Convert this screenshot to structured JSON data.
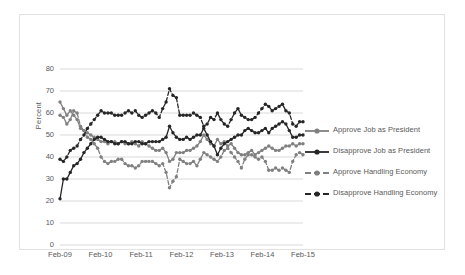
{
  "chart_data": {
    "type": "line",
    "title": "",
    "xlabel": "",
    "ylabel": "Percent",
    "ylim": [
      0,
      80
    ],
    "yticks": [
      0,
      10,
      20,
      30,
      40,
      50,
      60,
      70,
      80
    ],
    "xticks": [
      "Feb-09",
      "Feb-10",
      "Feb-11",
      "Feb-12",
      "Feb-13",
      "Feb-14",
      "Feb-15"
    ],
    "grid": "horizontal",
    "legend_position": "right",
    "colors": {
      "approve_job": "#808080",
      "disapprove_job": "#262626",
      "approve_economy": "#808080",
      "disapprove_economy": "#262626",
      "gridline": "#d9d9d9",
      "text": "#595959",
      "frame": "#e2e2e2"
    },
    "series": [
      {
        "name": "Approve Job as President",
        "style": "solid",
        "color": "#808080",
        "values": [
          65,
          62,
          59,
          61,
          59,
          57,
          53,
          52,
          51,
          50,
          49,
          48,
          47,
          47,
          46,
          47,
          47,
          46,
          47,
          46,
          46,
          47,
          46,
          45,
          47,
          46,
          45,
          44,
          43,
          43,
          44,
          42,
          38,
          39,
          42,
          42,
          42,
          43,
          43,
          44,
          45,
          47,
          50,
          48,
          46,
          45,
          48,
          46,
          47,
          45,
          46,
          44,
          42,
          41,
          41,
          42,
          43,
          41,
          42,
          43,
          44,
          45,
          44,
          43,
          43,
          44,
          45,
          45,
          46,
          45,
          46,
          46
        ]
      },
      {
        "name": "Disapprove Job as President",
        "style": "solid",
        "color": "#262626",
        "values": [
          21,
          30,
          30,
          33,
          36,
          37,
          39,
          42,
          44,
          46,
          48,
          49,
          49,
          48,
          47,
          47,
          46,
          46,
          47,
          47,
          46,
          46,
          47,
          47,
          46,
          46,
          47,
          47,
          47,
          47,
          48,
          49,
          54,
          51,
          49,
          48,
          48,
          49,
          48,
          49,
          50,
          50,
          53,
          50,
          47,
          45,
          41,
          44,
          46,
          47,
          48,
          49,
          50,
          50,
          52,
          53,
          52,
          51,
          51,
          52,
          53,
          51,
          53,
          54,
          55,
          56,
          55,
          52,
          49,
          49,
          50,
          50
        ]
      },
      {
        "name": "Approve Handling Economy",
        "style": "dashed",
        "color": "#808080",
        "values": [
          59,
          58,
          55,
          57,
          61,
          60,
          54,
          52,
          49,
          48,
          46,
          44,
          40,
          38,
          37,
          38,
          38,
          39,
          39,
          37,
          36,
          36,
          35,
          36,
          38,
          38,
          38,
          38,
          37,
          36,
          37,
          33,
          26,
          29,
          31,
          39,
          38,
          37,
          37,
          38,
          36,
          39,
          42,
          41,
          40,
          39,
          38,
          40,
          43,
          44,
          42,
          40,
          38,
          35,
          39,
          41,
          41,
          40,
          39,
          40,
          38,
          34,
          34,
          35,
          34,
          35,
          34,
          33,
          38,
          41,
          42,
          41
        ]
      },
      {
        "name": "Disapprove Handling Economy",
        "style": "dashed",
        "color": "#262626",
        "values": [
          39,
          38,
          40,
          43,
          44,
          45,
          48,
          50,
          53,
          55,
          57,
          59,
          61,
          60,
          60,
          60,
          59,
          59,
          59,
          60,
          61,
          60,
          61,
          59,
          58,
          59,
          60,
          61,
          60,
          58,
          62,
          65,
          71,
          68,
          67,
          59,
          59,
          59,
          59,
          60,
          59,
          58,
          54,
          55,
          58,
          57,
          60,
          57,
          55,
          54,
          57,
          60,
          62,
          59,
          58,
          57,
          57,
          58,
          60,
          62,
          64,
          63,
          61,
          62,
          63,
          64,
          61,
          60,
          55,
          54,
          56,
          56
        ]
      }
    ]
  },
  "legend": {
    "items": [
      {
        "label": "Approve Job as President"
      },
      {
        "label": "Disapprove Job as President"
      },
      {
        "label": "Approve Handling Economy"
      },
      {
        "label": "Disapprove Handling Economy"
      }
    ]
  }
}
